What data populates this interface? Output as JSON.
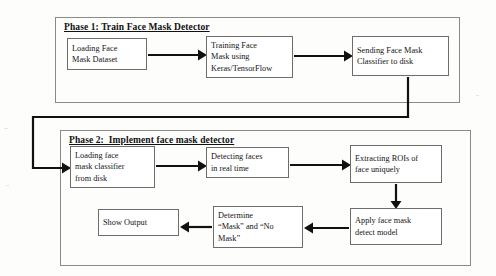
{
  "document": {
    "type": "flowchart",
    "title": "Face Mask Detector System Flowchart"
  },
  "phases": [
    {
      "id": "phase1",
      "title": "Phase 1: Train Face Mask Detector",
      "nodes": [
        {
          "id": "load-dataset",
          "label": "Loading Face\nMask Dataset"
        },
        {
          "id": "train-model",
          "label": "Training Face\nMask using\nKeras/TensorFlow"
        },
        {
          "id": "send-classifier",
          "label": "Sending Face Mask\nClassifier to disk"
        }
      ]
    },
    {
      "id": "phase2",
      "title": "Phase 2:  Implement face mask detector",
      "nodes": [
        {
          "id": "load-classifier",
          "label": "Loading face\nmask classifier\nfrom disk"
        },
        {
          "id": "detect-faces",
          "label": "Detecting faces\nin real time"
        },
        {
          "id": "extract-rois",
          "label": "Extracting ROIs of\nface uniquely"
        },
        {
          "id": "apply-model",
          "label": "Apply face mask\ndetect model"
        },
        {
          "id": "determine",
          "label": "Determine\n“Mask” and “No\nMask”"
        },
        {
          "id": "show-output",
          "label": "Show Output"
        }
      ]
    }
  ],
  "connections": [
    {
      "id": "c1",
      "from": "load-dataset",
      "to": "train-model",
      "direction": "right"
    },
    {
      "id": "c2",
      "from": "train-model",
      "to": "send-classifier",
      "direction": "right"
    },
    {
      "id": "c3",
      "from": "send-classifier",
      "to": "load-classifier",
      "direction": "down-left-down-right"
    },
    {
      "id": "c4",
      "from": "load-classifier",
      "to": "detect-faces",
      "direction": "right"
    },
    {
      "id": "c5",
      "from": "detect-faces",
      "to": "extract-rois",
      "direction": "right"
    },
    {
      "id": "c6",
      "from": "extract-rois",
      "to": "apply-model",
      "direction": "down"
    },
    {
      "id": "c7",
      "from": "apply-model",
      "to": "determine",
      "direction": "left"
    },
    {
      "id": "c8",
      "from": "determine",
      "to": "show-output",
      "direction": "left"
    }
  ],
  "colors": {
    "panel_border": "#8a8a8a",
    "node_border": "#6d6d6d",
    "connector": "#111111",
    "text": "#141414",
    "background": "#fdfdfc"
  }
}
